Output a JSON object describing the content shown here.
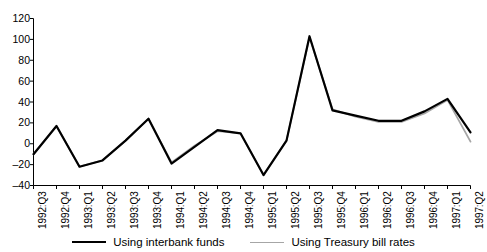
{
  "chart_data": {
    "type": "line",
    "title": "",
    "xlabel": "",
    "ylabel": "",
    "ylim": [
      -40,
      120
    ],
    "yticks": [
      120,
      100,
      80,
      60,
      40,
      20,
      0,
      -20,
      -40
    ],
    "ytick_labels": [
      "120",
      "100",
      "80",
      "60",
      "40",
      "20",
      "0",
      "–20",
      "–40"
    ],
    "grid": false,
    "legend_position": "bottom-center",
    "categories": [
      "1992:Q3",
      "1992:Q4",
      "1993:Q1",
      "1993:Q2",
      "1993:Q3",
      "1993:Q4",
      "1994:Q1",
      "1994:Q2",
      "1994:Q3",
      "1994:Q4",
      "1995:Q1",
      "1995:Q2",
      "1995:Q3",
      "1995:Q4",
      "1996:Q1",
      "1996:Q2",
      "1996:Q3",
      "1996:Q4",
      "1997:Q1",
      "1997:Q2"
    ],
    "series": [
      {
        "name": "Using interbank funds",
        "color": "#000000",
        "width": 2.2,
        "values": [
          -10,
          17,
          -22,
          -16,
          3,
          24,
          -19,
          -3,
          13,
          10,
          -30,
          3,
          103,
          32,
          27,
          22,
          22,
          31,
          43,
          11
        ]
      },
      {
        "name": "Using Treasury bill rates",
        "color": "#a6a6a6",
        "width": 1.8,
        "values": [
          -10,
          17,
          -22,
          -16,
          3,
          24,
          -18,
          -2,
          12,
          10,
          -30,
          3,
          102,
          33,
          26,
          21,
          21,
          29,
          42,
          2
        ]
      }
    ]
  },
  "legend": {
    "entries": [
      {
        "label": "Using interbank funds"
      },
      {
        "label": "Using Treasury bill rates"
      }
    ]
  }
}
